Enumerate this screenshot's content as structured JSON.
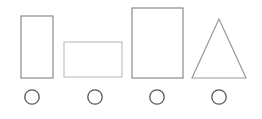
{
  "figure": {
    "canvas": {
      "width": 262,
      "height": 119,
      "background_color": "#ffffff"
    },
    "baseline_y": 78,
    "shapes": [
      {
        "id": "shape-1",
        "name": "tall-narrow-rectangle",
        "type": "rectangle",
        "x": 21,
        "y": 16,
        "width": 32,
        "height": 62,
        "stroke_color": "#8a8a8e",
        "stroke_width": 1.2,
        "fill": "none"
      },
      {
        "id": "shape-2",
        "name": "wide-short-rectangle",
        "type": "rectangle",
        "x": 64,
        "y": 42,
        "width": 58,
        "height": 35,
        "stroke_color": "#c2c2c6",
        "stroke_width": 1.2,
        "fill": "none"
      },
      {
        "id": "shape-3",
        "name": "large-rectangle",
        "type": "rectangle",
        "x": 132,
        "y": 8,
        "width": 51,
        "height": 70,
        "stroke_color": "#8a8a8e",
        "stroke_width": 1.2,
        "fill": "none"
      },
      {
        "id": "shape-4",
        "name": "triangle",
        "type": "triangle",
        "points": "219,19 246,78 192,78",
        "apex_x": 219,
        "apex_y": 19,
        "base_left_x": 192,
        "base_right_x": 246,
        "base_y": 78,
        "stroke_color": "#9a9a9e",
        "stroke_width": 1.2,
        "fill": "none"
      }
    ],
    "options": [
      {
        "id": "option-1",
        "name": "option-circle-1",
        "cx": 32,
        "cy": 97,
        "r": 7.2,
        "stroke_color": "#55555a",
        "stroke_width": 1.3,
        "selected": false
      },
      {
        "id": "option-2",
        "name": "option-circle-2",
        "cx": 95,
        "cy": 97,
        "r": 7.2,
        "stroke_color": "#55555a",
        "stroke_width": 1.3,
        "selected": false
      },
      {
        "id": "option-3",
        "name": "option-circle-3",
        "cx": 157,
        "cy": 97,
        "r": 7.2,
        "stroke_color": "#55555a",
        "stroke_width": 1.3,
        "selected": false
      },
      {
        "id": "option-4",
        "name": "option-circle-4",
        "cx": 219,
        "cy": 97,
        "r": 7.2,
        "stroke_color": "#55555a",
        "stroke_width": 1.3,
        "selected": false
      }
    ]
  }
}
